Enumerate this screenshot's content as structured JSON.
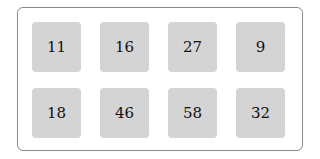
{
  "tiles": [
    {
      "value": "11"
    },
    {
      "value": "16"
    },
    {
      "value": "27"
    },
    {
      "value": "9"
    },
    {
      "value": "18"
    },
    {
      "value": "46"
    },
    {
      "value": "58"
    },
    {
      "value": "32"
    }
  ],
  "colors": {
    "tile": "#d4d4d4",
    "border": "#8a8a8a",
    "background": "#ffffff"
  }
}
